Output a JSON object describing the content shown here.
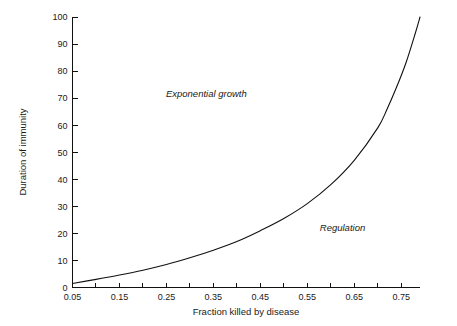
{
  "chart_data": {
    "type": "line",
    "title": "",
    "xlabel": "Fraction killed by disease",
    "ylabel": "Duration of immunity",
    "xlim": [
      0.05,
      0.79
    ],
    "ylim": [
      0,
      100
    ],
    "grid": false,
    "legend": "none",
    "x_ticks": [
      0.05,
      0.1,
      0.15,
      0.2,
      0.25,
      0.3,
      0.35,
      0.4,
      0.45,
      0.5,
      0.55,
      0.6,
      0.65,
      0.7,
      0.75
    ],
    "x_tick_labels": [
      "0.05",
      "",
      "0.15",
      "",
      "0.25",
      "",
      "0.35",
      "",
      "0.45",
      "",
      "0.55",
      "",
      "0.65",
      "",
      "0.75"
    ],
    "y_ticks": [
      0,
      10,
      20,
      30,
      40,
      50,
      60,
      70,
      80,
      90,
      100
    ],
    "y_tick_labels": [
      "0",
      "10",
      "20",
      "30",
      "40",
      "50",
      "60",
      "70",
      "80",
      "90",
      "100"
    ],
    "series": [
      {
        "name": "threshold-curve",
        "x": [
          0.05,
          0.1,
          0.15,
          0.2,
          0.25,
          0.3,
          0.35,
          0.4,
          0.45,
          0.5,
          0.55,
          0.6,
          0.65,
          0.7,
          0.72,
          0.74,
          0.76,
          0.78,
          0.79
        ],
        "values": [
          1.5,
          3.0,
          4.6,
          6.4,
          8.5,
          11.0,
          13.8,
          17.0,
          21.0,
          25.5,
          31.0,
          38.0,
          47.0,
          59.0,
          66.0,
          74.0,
          83.0,
          94.0,
          100.0
        ]
      }
    ],
    "annotations": [
      {
        "text": "Exponential growth",
        "x": 0.335,
        "y": 70.5,
        "style": "italic"
      },
      {
        "text": "Regulation",
        "x": 0.625,
        "y": 21.0,
        "style": "italic"
      }
    ],
    "colors": {
      "curve": "#111111",
      "axis": "#111111",
      "text": "#1a1a1a",
      "background": "#ffffff"
    }
  }
}
